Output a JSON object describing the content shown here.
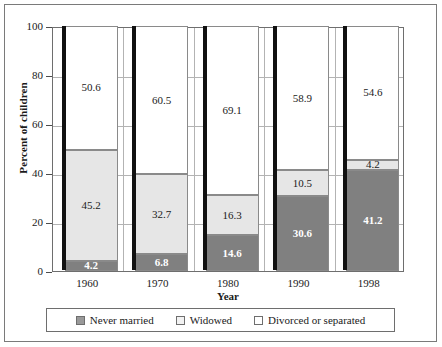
{
  "chart_data": {
    "type": "bar",
    "subtype": "stacked-bar",
    "title": "",
    "xlabel": "Year",
    "ylabel": "Percent of children",
    "categories": [
      "1960",
      "1970",
      "1980",
      "1990",
      "1998"
    ],
    "ylim": [
      0,
      100
    ],
    "yticks": [
      0,
      20,
      40,
      60,
      80,
      100
    ],
    "ytick_labels": [
      "0",
      "20",
      "40",
      "60",
      "80",
      "100"
    ],
    "grid": true,
    "legend_position": "bottom",
    "stack_order_bottom_to_top": [
      "Never married",
      "Widowed",
      "Divorced or separated"
    ],
    "series": [
      {
        "name": "Never married",
        "color": "#808080",
        "values": [
          4.2,
          6.8,
          14.6,
          30.6,
          41.2
        ],
        "labels": [
          "4.2",
          "6.8",
          "14.6",
          "30.6",
          "41.2"
        ]
      },
      {
        "name": "Widowed",
        "color": "#e6e6e6",
        "values": [
          45.2,
          32.7,
          16.3,
          10.5,
          4.2
        ],
        "labels": [
          "45.2",
          "32.7",
          "16.3",
          "10.5",
          "4.2"
        ]
      },
      {
        "name": "Divorced or separated",
        "color": "#ffffff",
        "values": [
          50.6,
          60.5,
          69.1,
          58.9,
          54.6
        ],
        "labels": [
          "50.6",
          "60.5",
          "69.1",
          "58.9",
          "54.6"
        ]
      }
    ]
  },
  "legend": {
    "items": [
      {
        "label": "Never married",
        "color": "#999999"
      },
      {
        "label": "Widowed",
        "color": "#f2f2f2"
      },
      {
        "label": "Divorced or separated",
        "color": "#ffffff"
      }
    ]
  },
  "axes": {
    "y_title": "Percent of children",
    "x_title": "Year"
  }
}
